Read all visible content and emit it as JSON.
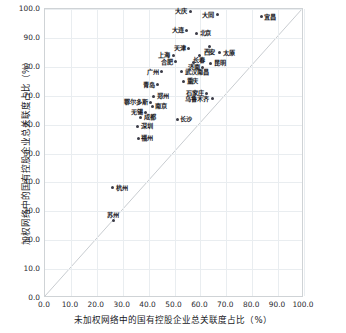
{
  "chart_data": {
    "type": "scatter",
    "title": "",
    "xlabel": "未加权网络中的国有控股企业总关联度占比（%）",
    "ylabel": "加权网络中的国有控股企业总关联度占比（%）",
    "xlim": [
      0.0,
      100.0
    ],
    "ylim": [
      0.0,
      100.0
    ],
    "xticks": [
      "0.0",
      "10.0",
      "20.0",
      "30.0",
      "40.0",
      "50.0",
      "60.0",
      "70.0",
      "80.0",
      "90.0",
      "100.0"
    ],
    "yticks": [
      "0.0",
      "10.0",
      "20.0",
      "30.0",
      "40.0",
      "50.0",
      "60.0",
      "70.0",
      "80.0",
      "90.0",
      "100.0"
    ],
    "grid": true,
    "legend": "none",
    "reference_line": {
      "name": "y=x 对角参考线",
      "from": [
        0,
        0
      ],
      "to": [
        100,
        100
      ],
      "color": "#c8ccd0"
    },
    "point_color": "#3b3b46",
    "points": [
      {
        "label": "大庆",
        "x": 56.0,
        "y": 99.2,
        "pos": "left"
      },
      {
        "label": "大同",
        "x": 66.5,
        "y": 98.0,
        "pos": "left"
      },
      {
        "label": "宜昌",
        "x": 83.5,
        "y": 97.3,
        "pos": "right"
      },
      {
        "label": "大连",
        "x": 54.7,
        "y": 92.6,
        "pos": "left"
      },
      {
        "label": "北京",
        "x": 58.5,
        "y": 91.6,
        "pos": "right"
      },
      {
        "label": "天津",
        "x": 55.5,
        "y": 86.5,
        "pos": "left"
      },
      {
        "label": "西安",
        "x": 63.5,
        "y": 87.0,
        "pos": "below"
      },
      {
        "label": "太原",
        "x": 67.5,
        "y": 84.8,
        "pos": "right"
      },
      {
        "label": "上海",
        "x": 49.5,
        "y": 84.0,
        "pos": "left"
      },
      {
        "label": "长春",
        "x": 59.5,
        "y": 84.0,
        "pos": "below"
      },
      {
        "label": "合肥",
        "x": 50.5,
        "y": 81.8,
        "pos": "left"
      },
      {
        "label": "济南",
        "x": 57.5,
        "y": 81.5,
        "pos": "below"
      },
      {
        "label": "昆明",
        "x": 64.0,
        "y": 81.3,
        "pos": "right"
      },
      {
        "label": "南昌",
        "x": 61.0,
        "y": 79.8,
        "pos": "below"
      },
      {
        "label": "广州",
        "x": 45.0,
        "y": 78.3,
        "pos": "left"
      },
      {
        "label": "武汉",
        "x": 52.8,
        "y": 78.3,
        "pos": "right"
      },
      {
        "label": "重庆",
        "x": 53.5,
        "y": 75.0,
        "pos": "right"
      },
      {
        "label": "青岛",
        "x": 43.5,
        "y": 73.8,
        "pos": "left"
      },
      {
        "label": "石家庄",
        "x": 62.5,
        "y": 70.8,
        "pos": "left"
      },
      {
        "label": "郑州",
        "x": 42.0,
        "y": 69.8,
        "pos": "right"
      },
      {
        "label": "乌鲁木齐",
        "x": 64.5,
        "y": 69.0,
        "pos": "left"
      },
      {
        "label": "鄂尔多斯",
        "x": 40.8,
        "y": 67.8,
        "pos": "left"
      },
      {
        "label": "南京",
        "x": 41.5,
        "y": 66.3,
        "pos": "right"
      },
      {
        "label": "无锡",
        "x": 38.8,
        "y": 64.3,
        "pos": "left"
      },
      {
        "label": "成都",
        "x": 37.0,
        "y": 62.5,
        "pos": "right"
      },
      {
        "label": "长沙",
        "x": 51.0,
        "y": 61.8,
        "pos": "right"
      },
      {
        "label": "深圳",
        "x": 35.8,
        "y": 59.5,
        "pos": "right"
      },
      {
        "label": "福州",
        "x": 36.0,
        "y": 55.3,
        "pos": "right"
      },
      {
        "label": "杭州",
        "x": 26.2,
        "y": 38.2,
        "pos": "right"
      },
      {
        "label": "苏州",
        "x": 26.3,
        "y": 26.8,
        "pos": "above"
      }
    ]
  }
}
